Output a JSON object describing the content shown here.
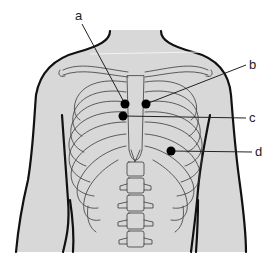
{
  "figure": {
    "colors": {
      "skin_fill": "#d8d8d8",
      "outline": "#111111",
      "bone_line": "#3a3a3a",
      "marker": "#000000",
      "background": "#ffffff"
    },
    "markers": [
      {
        "id": "a",
        "label": "a",
        "x": 125,
        "y": 104,
        "label_x": 77,
        "label_y": 17
      },
      {
        "id": "b",
        "label": "b",
        "x": 146,
        "y": 104,
        "label_x": 252,
        "label_y": 69
      },
      {
        "id": "c",
        "label": "c",
        "x": 123,
        "y": 116,
        "label_x": 252,
        "label_y": 122
      },
      {
        "id": "d",
        "label": "d",
        "x": 171,
        "y": 151,
        "label_x": 257,
        "label_y": 156
      }
    ]
  }
}
